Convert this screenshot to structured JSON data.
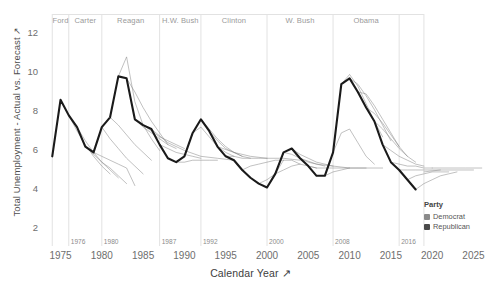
{
  "axes": {
    "y_title": "Total Unemployment - Actual vs. Forecast",
    "y_sort_icon": "sort-arrow-icon",
    "x_title": "Calendar Year",
    "x_sort_icon": "sort-arrow-icon"
  },
  "legend": {
    "title": "Party",
    "entries": [
      {
        "label": "Democrat",
        "color": "#8a8a8a"
      },
      {
        "label": "Republican",
        "color": "#4a4a4a"
      }
    ]
  },
  "chart_data": {
    "type": "line",
    "title": "",
    "subtitle": "",
    "xlabel": "Calendar Year",
    "ylabel": "Total Unemployment - Actual vs. Forecast",
    "xlim": [
      1973,
      2027
    ],
    "ylim": [
      1.0,
      12.9
    ],
    "xticks": [
      1975,
      1980,
      1985,
      1990,
      1995,
      2000,
      2005,
      2010,
      2015,
      2020,
      2025
    ],
    "yticks": [
      2,
      4,
      6,
      8,
      10,
      12
    ],
    "grid": false,
    "legend_position": "right-bottom",
    "presidential_terms": [
      {
        "name": "Ford",
        "party": "Republican",
        "start": 1974,
        "end": 1976,
        "label_year": 1975.0,
        "boundary_label": ""
      },
      {
        "name": "Carter",
        "party": "Democrat",
        "start": 1976,
        "end": 1980,
        "label_year": 1978.0,
        "boundary_label": "1976"
      },
      {
        "name": "Reagan",
        "party": "Republican",
        "start": 1980,
        "end": 1987,
        "label_year": 1983.5,
        "boundary_label": "1980"
      },
      {
        "name": "H.W. Bush",
        "party": "Republican",
        "start": 1987,
        "end": 1992,
        "label_year": 1989.5,
        "boundary_label": "1987"
      },
      {
        "name": "Clinton",
        "party": "Democrat",
        "start": 1992,
        "end": 2000,
        "label_year": 1996.0,
        "boundary_label": "1992"
      },
      {
        "name": "W. Bush",
        "party": "Republican",
        "start": 2000,
        "end": 2008,
        "label_year": 2004.0,
        "boundary_label": "2000"
      },
      {
        "name": "Obama",
        "party": "Democrat",
        "start": 2008,
        "end": 2016,
        "label_year": 2012.0,
        "boundary_label": "2008"
      },
      {
        "name": "",
        "party": "Republican",
        "start": 2016,
        "end": 2019,
        "label_year": 2017.5,
        "boundary_label": "2016"
      }
    ],
    "series": [
      {
        "name": "Actual Unemployment",
        "kind": "actual",
        "style": "thick",
        "color": "#1a1a1a",
        "x": [
          1974,
          1975,
          1976,
          1977,
          1978,
          1979,
          1980,
          1981,
          1982,
          1983,
          1984,
          1985,
          1986,
          1987,
          1988,
          1989,
          1990,
          1991,
          1992,
          1993,
          1994,
          1995,
          1996,
          1997,
          1998,
          1999,
          2000,
          2001,
          2002,
          2003,
          2004,
          2005,
          2006,
          2007,
          2008,
          2009,
          2010,
          2011,
          2012,
          2013,
          2014,
          2015,
          2016,
          2017,
          2018
        ],
        "y": [
          5.6,
          8.5,
          7.7,
          7.1,
          6.1,
          5.8,
          7.1,
          7.6,
          9.7,
          9.6,
          7.5,
          7.2,
          7.0,
          6.2,
          5.5,
          5.3,
          5.6,
          6.8,
          7.5,
          6.9,
          6.1,
          5.6,
          5.4,
          4.9,
          4.5,
          4.2,
          4.0,
          4.7,
          5.8,
          6.0,
          5.5,
          5.1,
          4.6,
          4.6,
          5.8,
          9.3,
          9.6,
          8.9,
          8.1,
          7.4,
          6.2,
          5.3,
          4.9,
          4.4,
          3.9
        ]
      },
      {
        "name": "Forecast 1976",
        "kind": "forecast",
        "style": "thin",
        "color": "#7d7d7d",
        "x": [
          1976,
          1977,
          1978,
          1979,
          1980,
          1981
        ],
        "y": [
          7.7,
          6.9,
          6.2,
          5.6,
          5.1,
          4.7
        ]
      },
      {
        "name": "Forecast 1977",
        "kind": "forecast",
        "style": "thin",
        "color": "#7d7d7d",
        "x": [
          1977,
          1978,
          1979,
          1980,
          1981,
          1982
        ],
        "y": [
          7.1,
          6.4,
          5.8,
          5.3,
          4.9,
          4.5
        ]
      },
      {
        "name": "Forecast 1978",
        "kind": "forecast",
        "style": "thin",
        "color": "#7d7d7d",
        "x": [
          1978,
          1979,
          1980,
          1981,
          1982,
          1983
        ],
        "y": [
          6.1,
          5.7,
          5.3,
          5.0,
          4.6,
          4.2
        ]
      },
      {
        "name": "Forecast 1979",
        "kind": "forecast",
        "style": "thin",
        "color": "#7d7d7d",
        "x": [
          1979,
          1980,
          1981,
          1982,
          1983,
          1984
        ],
        "y": [
          5.8,
          5.6,
          5.4,
          5.2,
          5.0,
          4.1
        ]
      },
      {
        "name": "Forecast 1980",
        "kind": "forecast",
        "style": "thin",
        "color": "#7d7d7d",
        "x": [
          1980,
          1981,
          1982,
          1983,
          1984,
          1985
        ],
        "y": [
          7.1,
          6.5,
          6.0,
          5.5,
          5.1,
          4.7
        ]
      },
      {
        "name": "Forecast 1981",
        "kind": "forecast",
        "style": "thin",
        "color": "#7d7d7d",
        "x": [
          1981,
          1982,
          1983,
          1984,
          1985,
          1986
        ],
        "y": [
          7.6,
          7.2,
          6.7,
          6.2,
          5.8,
          5.4
        ]
      },
      {
        "name": "Forecast 1982",
        "kind": "forecast",
        "style": "thin",
        "color": "#7d7d7d",
        "x": [
          1982,
          1983,
          1984,
          1985,
          1986,
          1987
        ],
        "y": [
          9.7,
          10.7,
          8.4,
          7.2,
          6.5,
          5.9
        ]
      },
      {
        "name": "Forecast 1983",
        "kind": "forecast",
        "style": "thin",
        "color": "#7d7d7d",
        "x": [
          1983,
          1984,
          1985,
          1986,
          1987,
          1988
        ],
        "y": [
          9.6,
          8.9,
          8.1,
          7.4,
          6.8,
          6.2
        ]
      },
      {
        "name": "Forecast 1984",
        "kind": "forecast",
        "style": "thin",
        "color": "#7d7d7d",
        "x": [
          1984,
          1985,
          1986,
          1987,
          1988,
          1989
        ],
        "y": [
          7.5,
          7.1,
          6.8,
          6.5,
          6.2,
          6.0
        ]
      },
      {
        "name": "Forecast 1985",
        "kind": "forecast",
        "style": "thin",
        "color": "#7d7d7d",
        "x": [
          1985,
          1986,
          1987,
          1988,
          1989,
          1990
        ],
        "y": [
          7.2,
          6.9,
          6.6,
          6.4,
          6.2,
          6.0
        ]
      },
      {
        "name": "Forecast 1987",
        "kind": "forecast",
        "style": "thin",
        "color": "#7d7d7d",
        "x": [
          1987,
          1988,
          1989,
          1990,
          1991,
          1992
        ],
        "y": [
          6.2,
          6.0,
          5.8,
          5.7,
          5.6,
          5.5
        ]
      },
      {
        "name": "Forecast 1989",
        "kind": "forecast",
        "style": "thin",
        "color": "#7d7d7d",
        "x": [
          1989,
          1990,
          1991,
          1992,
          1993,
          1994
        ],
        "y": [
          5.3,
          5.3,
          5.4,
          5.4,
          5.4,
          5.4
        ]
      },
      {
        "name": "Forecast 1991",
        "kind": "forecast",
        "style": "thin",
        "color": "#7d7d7d",
        "x": [
          1991,
          1992,
          1993,
          1994,
          1995,
          1996
        ],
        "y": [
          6.8,
          7.1,
          6.6,
          6.1,
          5.8,
          5.6
        ]
      },
      {
        "name": "Forecast 1992",
        "kind": "forecast",
        "style": "thin",
        "color": "#7d7d7d",
        "x": [
          1992,
          1993,
          1994,
          1995,
          1996,
          1997
        ],
        "y": [
          7.5,
          7.0,
          6.5,
          6.1,
          5.8,
          5.6
        ]
      },
      {
        "name": "Forecast 1993",
        "kind": "forecast",
        "style": "thin",
        "color": "#7d7d7d",
        "x": [
          1993,
          1994,
          1995,
          1996,
          1997,
          1998
        ],
        "y": [
          6.9,
          6.4,
          6.0,
          5.8,
          5.6,
          5.5
        ]
      },
      {
        "name": "Forecast 1995",
        "kind": "forecast",
        "style": "thin",
        "color": "#7d7d7d",
        "x": [
          1995,
          1996,
          1997,
          1998,
          1999,
          2000
        ],
        "y": [
          5.6,
          5.6,
          5.5,
          5.5,
          5.5,
          5.5
        ]
      },
      {
        "name": "Forecast 1997",
        "kind": "forecast",
        "style": "thin",
        "color": "#7d7d7d",
        "x": [
          1997,
          1998,
          1999,
          2000,
          2001,
          2002
        ],
        "y": [
          4.9,
          5.1,
          5.2,
          5.3,
          5.4,
          5.4
        ]
      },
      {
        "name": "Forecast 1999",
        "kind": "forecast",
        "style": "thin",
        "color": "#7d7d7d",
        "x": [
          1999,
          2000,
          2001,
          2002,
          2003,
          2004
        ],
        "y": [
          4.2,
          4.4,
          4.7,
          4.9,
          5.1,
          5.2
        ]
      },
      {
        "name": "Forecast 2001",
        "kind": "forecast",
        "style": "thin",
        "color": "#7d7d7d",
        "x": [
          2001,
          2002,
          2003,
          2004,
          2005,
          2006
        ],
        "y": [
          4.7,
          5.4,
          5.4,
          5.2,
          5.1,
          5.0
        ]
      },
      {
        "name": "Forecast 2002",
        "kind": "forecast",
        "style": "thin",
        "color": "#7d7d7d",
        "x": [
          2002,
          2003,
          2004,
          2005,
          2006,
          2007
        ],
        "y": [
          5.8,
          5.7,
          5.5,
          5.3,
          5.2,
          5.1
        ]
      },
      {
        "name": "Forecast 2003",
        "kind": "forecast",
        "style": "thin",
        "color": "#7d7d7d",
        "x": [
          2003,
          2004,
          2005,
          2006,
          2007,
          2008
        ],
        "y": [
          6.0,
          5.7,
          5.5,
          5.3,
          5.2,
          5.1
        ]
      },
      {
        "name": "Forecast 2005",
        "kind": "forecast",
        "style": "thin",
        "color": "#7d7d7d",
        "x": [
          2005,
          2006,
          2007,
          2008,
          2009,
          2010
        ],
        "y": [
          5.1,
          5.0,
          5.0,
          5.0,
          5.0,
          5.0
        ]
      },
      {
        "name": "Forecast 2007",
        "kind": "forecast",
        "style": "thin",
        "color": "#7d7d7d",
        "x": [
          2007,
          2008,
          2009,
          2010,
          2011,
          2012
        ],
        "y": [
          4.6,
          4.8,
          4.9,
          5.0,
          5.0,
          5.0
        ]
      },
      {
        "name": "Forecast 2008",
        "kind": "forecast",
        "style": "thin",
        "color": "#7d7d7d",
        "x": [
          2008,
          2009,
          2010,
          2011,
          2012,
          2013
        ],
        "y": [
          5.8,
          6.8,
          7.0,
          6.3,
          5.6,
          5.2
        ]
      },
      {
        "name": "Forecast 2009",
        "kind": "forecast",
        "style": "thin",
        "color": "#7d7d7d",
        "x": [
          2009,
          2010,
          2011,
          2012,
          2013,
          2014
        ],
        "y": [
          9.3,
          9.8,
          9.2,
          8.3,
          7.4,
          6.6
        ]
      },
      {
        "name": "Forecast 2010",
        "kind": "forecast",
        "style": "thin",
        "color": "#7d7d7d",
        "x": [
          2010,
          2011,
          2012,
          2013,
          2014,
          2015
        ],
        "y": [
          9.6,
          9.3,
          8.7,
          8.0,
          7.2,
          6.4
        ]
      },
      {
        "name": "Forecast 2011",
        "kind": "forecast",
        "style": "thin",
        "color": "#7d7d7d",
        "x": [
          2011,
          2012,
          2013,
          2014,
          2015,
          2016
        ],
        "y": [
          8.9,
          8.8,
          8.2,
          7.5,
          6.8,
          6.1
        ]
      },
      {
        "name": "Forecast 2012",
        "kind": "forecast",
        "style": "thin",
        "color": "#7d7d7d",
        "x": [
          2012,
          2013,
          2014,
          2015,
          2016,
          2017
        ],
        "y": [
          8.1,
          7.8,
          7.3,
          6.7,
          6.1,
          5.6
        ]
      },
      {
        "name": "Forecast 2013",
        "kind": "forecast",
        "style": "thin",
        "color": "#7d7d7d",
        "x": [
          2013,
          2014,
          2015,
          2016,
          2017,
          2018
        ],
        "y": [
          7.4,
          7.0,
          6.5,
          6.0,
          5.6,
          5.3
        ]
      },
      {
        "name": "Forecast 2014",
        "kind": "forecast",
        "style": "thin",
        "color": "#7d7d7d",
        "x": [
          2014,
          2015,
          2016,
          2017,
          2018,
          2019
        ],
        "y": [
          6.2,
          5.9,
          5.6,
          5.4,
          5.2,
          5.1
        ]
      },
      {
        "name": "Forecast 2015",
        "kind": "forecast",
        "style": "thin",
        "color": "#7d7d7d",
        "x": [
          2015,
          2016,
          2017,
          2018,
          2019,
          2020
        ],
        "y": [
          5.3,
          5.2,
          5.1,
          5.1,
          5.0,
          5.0
        ]
      },
      {
        "name": "Forecast 2016",
        "kind": "forecast",
        "style": "thin",
        "color": "#7d7d7d",
        "x": [
          2016,
          2017,
          2018,
          2019,
          2020,
          2021
        ],
        "y": [
          4.9,
          4.9,
          4.9,
          4.9,
          4.9,
          4.9
        ]
      },
      {
        "name": "Forecast 2017",
        "kind": "forecast",
        "style": "thin",
        "color": "#7d7d7d",
        "x": [
          2017,
          2018,
          2019,
          2020,
          2021,
          2022
        ],
        "y": [
          4.4,
          4.6,
          4.7,
          4.8,
          4.8,
          4.8
        ]
      },
      {
        "name": "Forecast 2018",
        "kind": "forecast",
        "style": "thin",
        "color": "#7d7d7d",
        "x": [
          2018,
          2019,
          2020,
          2021,
          2022,
          2023
        ],
        "y": [
          3.9,
          4.2,
          4.4,
          4.6,
          4.7,
          4.8
        ]
      },
      {
        "name": "Forecast long 1986",
        "kind": "forecast",
        "style": "thin",
        "color": "#7d7d7d",
        "x": [
          1986,
          1988,
          1990,
          1992,
          1994,
          1996
        ],
        "y": [
          7.0,
          6.3,
          5.9,
          5.6,
          5.5,
          5.4
        ]
      },
      {
        "name": "Forecast long 1994",
        "kind": "forecast",
        "style": "thin",
        "color": "#7d7d7d",
        "x": [
          1994,
          1996,
          1998,
          2000,
          2002,
          2004
        ],
        "y": [
          6.1,
          5.8,
          5.6,
          5.5,
          5.5,
          5.4
        ]
      },
      {
        "name": "Forecast long 2004",
        "kind": "forecast",
        "style": "thin",
        "color": "#7d7d7d",
        "x": [
          2004,
          2006,
          2008,
          2010,
          2012,
          2014
        ],
        "y": [
          5.5,
          5.2,
          5.1,
          5.0,
          5.0,
          5.0
        ]
      },
      {
        "name": "Forecast long 2019",
        "kind": "forecast",
        "style": "thin",
        "color": "#7d7d7d",
        "x": [
          2019,
          2021,
          2023,
          2025
        ],
        "y": [
          4.8,
          4.9,
          4.9,
          4.9
        ]
      },
      {
        "name": "Forecast long 2020",
        "kind": "forecast",
        "style": "thin",
        "color": "#7d7d7d",
        "x": [
          2020,
          2022,
          2024,
          2026
        ],
        "y": [
          5.0,
          5.0,
          5.0,
          5.0
        ]
      }
    ]
  }
}
